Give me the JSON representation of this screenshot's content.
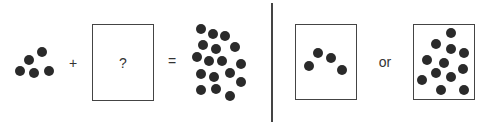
{
  "diagram": {
    "operators": {
      "plus": "+",
      "equals": "=",
      "or": "or"
    },
    "unknown_box_label": "?",
    "colors": {
      "dot": "#2a2a2a",
      "stroke": "#444444",
      "background": "#ffffff"
    },
    "groups": {
      "addend_dots": {
        "count": 5,
        "points": [
          [
            20,
            71
          ],
          [
            29,
            60
          ],
          [
            42,
            52
          ],
          [
            34,
            73
          ],
          [
            49,
            71
          ]
        ]
      },
      "sum_dots": {
        "count": 16,
        "points": [
          [
            201,
            29
          ],
          [
            213,
            34
          ],
          [
            225,
            36
          ],
          [
            203,
            45
          ],
          [
            216,
            49
          ],
          [
            235,
            47
          ],
          [
            197,
            57
          ],
          [
            209,
            61
          ],
          [
            222,
            61
          ],
          [
            241,
            64
          ],
          [
            201,
            74
          ],
          [
            214,
            77
          ],
          [
            230,
            73
          ],
          [
            241,
            82
          ],
          [
            201,
            90
          ],
          [
            216,
            89
          ],
          [
            230,
            96
          ]
        ]
      },
      "option_a_dots": {
        "count": 4,
        "points": [
          [
            309,
            66
          ],
          [
            318,
            53
          ],
          [
            331,
            58
          ],
          [
            342,
            70
          ]
        ]
      },
      "option_b_dots": {
        "count": 12,
        "points": [
          [
            451,
            33
          ],
          [
            436,
            44
          ],
          [
            451,
            49
          ],
          [
            464,
            53
          ],
          [
            427,
            60
          ],
          [
            444,
            63
          ],
          [
            463,
            69
          ],
          [
            436,
            73
          ],
          [
            451,
            77
          ],
          [
            422,
            80
          ],
          [
            441,
            90
          ],
          [
            464,
            90
          ]
        ]
      }
    }
  }
}
